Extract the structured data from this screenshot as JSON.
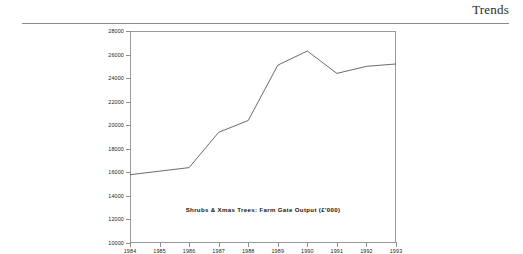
{
  "header": {
    "title": "Trends"
  },
  "chart_data": {
    "type": "line",
    "title": "Shrubs & Xmas Trees: Farm Gate Output (£'000)",
    "xlabel": "",
    "ylabel": "",
    "categories": [
      "1984",
      "1985",
      "1986",
      "1987",
      "1988",
      "1989",
      "1990",
      "1991",
      "1992",
      "1993"
    ],
    "x": [
      1984,
      1985,
      1986,
      1987,
      1988,
      1989,
      1990,
      1991,
      1992,
      1993
    ],
    "values": [
      15800,
      16100,
      16400,
      19400,
      20400,
      25100,
      26300,
      24400,
      25000,
      25200
    ],
    "series": [
      {
        "name": "Shrubs & Xmas Trees: Farm Gate Output (£'000)",
        "values": [
          15800,
          16100,
          16400,
          19400,
          20400,
          25100,
          26300,
          24400,
          25000,
          25200
        ]
      }
    ],
    "ylim": [
      10000,
      28000
    ],
    "yticks": [
      10000,
      12000,
      14000,
      16000,
      18000,
      20000,
      22000,
      24000,
      26000,
      28000
    ],
    "ytick_labels": [
      "10000",
      "12000",
      "14000",
      "16000",
      "18000",
      "20000",
      "22000",
      "24000",
      "26000",
      "28000"
    ],
    "xlim": [
      1984,
      1993
    ],
    "xtick_labels": [
      "1984",
      "1985",
      "1986",
      "1987",
      "1988",
      "1989",
      "1990",
      "1991",
      "1992",
      "1993"
    ],
    "grid": false,
    "legend": "none",
    "line_color": "#5a5a5a",
    "frame_color": "#9a9a9a"
  }
}
